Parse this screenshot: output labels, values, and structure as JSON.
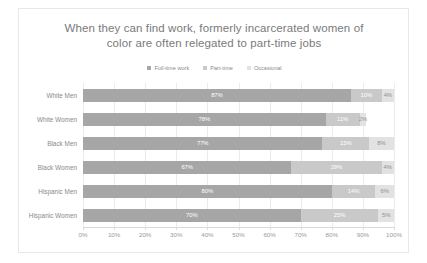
{
  "chart_data": {
    "type": "bar",
    "orientation": "horizontal",
    "stacked": true,
    "title": "When they can find work, formerly incarcerated women of color are often relegated to part-time jobs",
    "title_line_1": "When they can find work, formerly incarcerated women of",
    "title_line_2": "color are often relegated to part-time jobs",
    "xlabel": "",
    "ylabel": "",
    "xlim": [
      0,
      100
    ],
    "grid": true,
    "legend_position": "top",
    "categories": [
      "White Men",
      "White Women",
      "Black Men",
      "Black Women",
      "Hispanic Men",
      "Hispanic Women"
    ],
    "xticks": [
      "0%",
      "10%",
      "20%",
      "30%",
      "40%",
      "50%",
      "60%",
      "70%",
      "80%",
      "90%",
      "100%"
    ],
    "series": [
      {
        "name": "Full-time work",
        "color": "#a6a6a6",
        "values": [
          87,
          78,
          77,
          67,
          80,
          70
        ],
        "labels": [
          "87%",
          "78%",
          "77%",
          "67%",
          "80%",
          "70%"
        ]
      },
      {
        "name": "Part-time",
        "color": "#c9c9c9",
        "values": [
          10,
          11,
          15,
          29,
          14,
          25
        ],
        "labels": [
          "10%",
          "11%",
          "15%",
          "29%",
          "14%",
          "25%"
        ]
      },
      {
        "name": "Occasional",
        "color": "#e2e2e2",
        "values": [
          4,
          2,
          8,
          4,
          6,
          5
        ],
        "labels": [
          "4%",
          "2%",
          "8%",
          "4%",
          "6%",
          "5%"
        ]
      }
    ]
  },
  "colors": {
    "frame_border": "#e8e8e8",
    "background": "#ffffff",
    "title_text": "#7a7a7a",
    "axis_text": "#9a9a9a",
    "gridline": "#ebebeb"
  }
}
